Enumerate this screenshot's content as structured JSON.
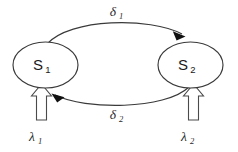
{
  "diagram": {
    "background_color": "#ffffff",
    "stroke_color": "#3a3a3a",
    "arrowhead_color": "#111111",
    "nodes": [
      {
        "id": "s1",
        "label": "S",
        "subscript": "1",
        "shape": "ellipse",
        "cx": 45.5,
        "cy": 65,
        "rx": 32.5,
        "ry": 23
      },
      {
        "id": "s2",
        "label": "S",
        "subscript": "2",
        "shape": "ellipse",
        "cx": 190.5,
        "cy": 65,
        "rx": 32.5,
        "ry": 23
      }
    ],
    "edges": [
      {
        "id": "delta1",
        "from": "s1",
        "to": "s2",
        "label": "δ",
        "subscript": "1",
        "label_x": 113,
        "label_y": 15,
        "direction": "left-to-right",
        "position": "top"
      },
      {
        "id": "delta2",
        "from": "s2",
        "to": "s1",
        "label": "δ",
        "subscript": "2",
        "label_x": 113,
        "label_y": 118,
        "direction": "right-to-left",
        "position": "bottom"
      }
    ],
    "inputs": [
      {
        "id": "lambda1",
        "target": "s1",
        "label": "λ",
        "subscript": "1",
        "label_x": 32,
        "label_y": 140,
        "arrow_style": "hollow-block-arrow",
        "direction": "up"
      },
      {
        "id": "lambda2",
        "target": "s2",
        "label": "λ",
        "subscript": "2",
        "label_x": 184,
        "label_y": 140,
        "arrow_style": "hollow-block-arrow",
        "direction": "up"
      }
    ]
  }
}
